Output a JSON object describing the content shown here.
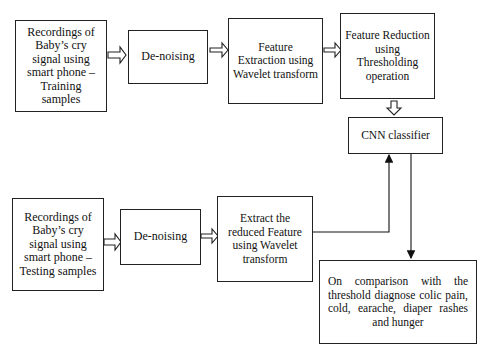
{
  "diagram": {
    "training_row": {
      "recording": "Recordings of Baby’s cry signal using smart phone – Training samples",
      "denoise": "De-noising",
      "extraction": "Feature Extraction using Wavelet transform",
      "reduction": "Feature Reduction using Thresholding operation"
    },
    "classifier": "CNN classifier",
    "testing_row": {
      "recording": "Recordings of Baby’s cry signal using smart phone – Testing samples",
      "denoise": "De-noising",
      "extraction": "Extract the reduced Feature using Wavelet transform"
    },
    "output": "On comparison with the threshold diagnose colic pain, cold, earache, diaper rashes and hunger",
    "edges": [
      [
        "training-recording",
        "training-denoise"
      ],
      [
        "training-denoise",
        "feature-extraction"
      ],
      [
        "feature-extraction",
        "feature-reduction"
      ],
      [
        "feature-reduction",
        "cnn-classifier"
      ],
      [
        "testing-recording",
        "testing-denoise"
      ],
      [
        "testing-denoise",
        "reduced-feature-extraction"
      ],
      [
        "reduced-feature-extraction",
        "cnn-classifier"
      ],
      [
        "cnn-classifier",
        "diagnosis-output"
      ]
    ]
  }
}
